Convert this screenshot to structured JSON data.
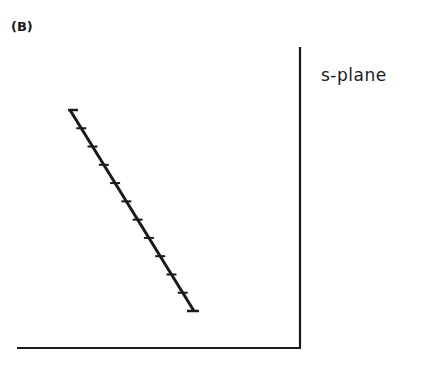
{
  "figure": {
    "panel_label": "(B)",
    "plane_label": "s-plane",
    "colors": {
      "ink": "#1a1a1a",
      "background": "#ffffff"
    },
    "axes": {
      "vertical": {
        "x": 300,
        "y1": 47,
        "y2": 348
      },
      "horizontal": {
        "y": 348,
        "x1": 17,
        "x2": 301
      }
    },
    "locus": {
      "start": {
        "x": 70,
        "y": 110
      },
      "end": {
        "x": 194,
        "y": 311
      },
      "start_cap": {
        "x1": 68,
        "x2": 78,
        "y": 110
      },
      "end_cap": {
        "x1": 187,
        "x2": 199,
        "y": 311
      },
      "tick_half_width": 5,
      "tick_count": 10
    }
  }
}
